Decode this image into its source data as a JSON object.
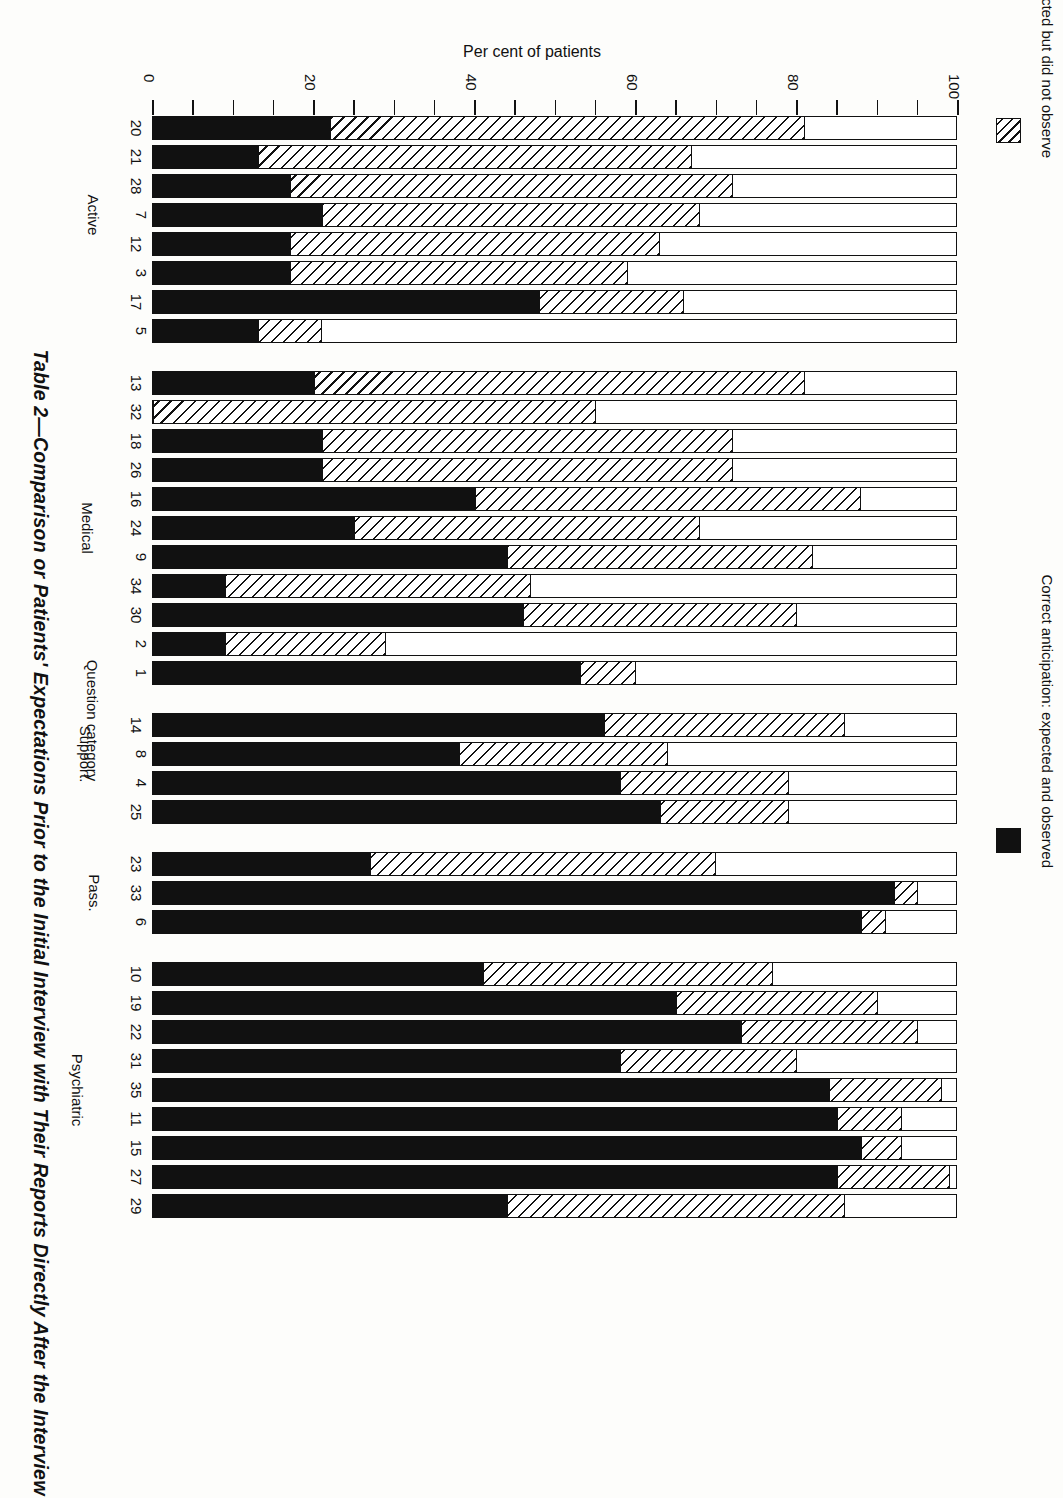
{
  "figure": {
    "title": "Table 2—Comparison or Patients' Expectations Prior to the Initial Interview with Their Reports Directly After the Interview",
    "value_axis_title": "Per cent of patients",
    "category_axis_title": "Question category"
  },
  "legend": [
    {
      "key": "incorrect",
      "swatch": "hatched",
      "label": "Incorrect anticipation: expected but did not observe"
    },
    {
      "key": "correct",
      "swatch": "solid-black",
      "label": "Correct anticipation: expected and observed"
    }
  ],
  "chart_data": {
    "type": "bar",
    "orientation": "horizontal-stacked",
    "title": "Table 2—Comparison or Patients' Expectations Prior to the Initial Interview with Their Reports Directly After the Interview",
    "xlabel": "Per cent of patients",
    "ylabel": "Question category",
    "xlim": [
      0,
      100
    ],
    "ticks": [
      0,
      20,
      40,
      60,
      80,
      100
    ],
    "minor_tick_interval": 5,
    "grid": false,
    "legend_position": "right",
    "series": [
      {
        "name": "Correct anticipation: expected and observed",
        "style": "solid-black"
      },
      {
        "name": "Incorrect anticipation: expected but did not observe",
        "style": "hatched"
      }
    ],
    "groups": [
      {
        "name": "Active",
        "bars": [
          {
            "label": "20",
            "correct": 22,
            "incorrect": 59
          },
          {
            "label": "21",
            "correct": 13,
            "incorrect": 54
          },
          {
            "label": "28",
            "correct": 17,
            "incorrect": 55
          },
          {
            "label": "7",
            "correct": 21,
            "incorrect": 47
          },
          {
            "label": "12",
            "correct": 17,
            "incorrect": 46
          },
          {
            "label": "3",
            "correct": 17,
            "incorrect": 42
          },
          {
            "label": "17",
            "correct": 48,
            "incorrect": 18
          },
          {
            "label": "5",
            "correct": 13,
            "incorrect": 8
          }
        ]
      },
      {
        "name": "Medical",
        "bars": [
          {
            "label": "13",
            "correct": 20,
            "incorrect": 61
          },
          {
            "label": "32",
            "correct": 0,
            "incorrect": 55
          },
          {
            "label": "18",
            "correct": 21,
            "incorrect": 51
          },
          {
            "label": "26",
            "correct": 21,
            "incorrect": 51
          },
          {
            "label": "16",
            "correct": 40,
            "incorrect": 48
          },
          {
            "label": "24",
            "correct": 25,
            "incorrect": 43
          },
          {
            "label": "9",
            "correct": 44,
            "incorrect": 38
          },
          {
            "label": "34",
            "correct": 9,
            "incorrect": 38
          },
          {
            "label": "30",
            "correct": 46,
            "incorrect": 34
          },
          {
            "label": "2",
            "correct": 9,
            "incorrect": 20
          },
          {
            "label": "1",
            "correct": 53,
            "incorrect": 7
          }
        ]
      },
      {
        "name": "Support.",
        "bars": [
          {
            "label": "14",
            "correct": 56,
            "incorrect": 30
          },
          {
            "label": "8",
            "correct": 38,
            "incorrect": 26
          },
          {
            "label": "4",
            "correct": 58,
            "incorrect": 21
          },
          {
            "label": "25",
            "correct": 63,
            "incorrect": 16
          }
        ]
      },
      {
        "name": "Pass.",
        "bars": [
          {
            "label": "23",
            "correct": 27,
            "incorrect": 43
          },
          {
            "label": "33",
            "correct": 92,
            "incorrect": 3
          },
          {
            "label": "6",
            "correct": 88,
            "incorrect": 3
          }
        ]
      },
      {
        "name": "Psychiatric",
        "bars": [
          {
            "label": "10",
            "correct": 41,
            "incorrect": 36
          },
          {
            "label": "19",
            "correct": 65,
            "incorrect": 25
          },
          {
            "label": "22",
            "correct": 73,
            "incorrect": 22
          },
          {
            "label": "31",
            "correct": 58,
            "incorrect": 22
          },
          {
            "label": "35",
            "correct": 84,
            "incorrect": 14
          },
          {
            "label": "11",
            "correct": 85,
            "incorrect": 8
          },
          {
            "label": "15",
            "correct": 88,
            "incorrect": 5
          },
          {
            "label": "27",
            "correct": 85,
            "incorrect": 14
          },
          {
            "label": "29",
            "correct": 44,
            "incorrect": 42
          }
        ]
      }
    ]
  }
}
